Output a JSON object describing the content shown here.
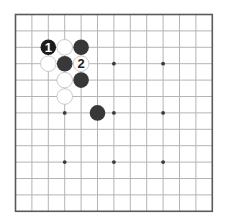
{
  "board": {
    "size": 13,
    "origin_x": 15.5,
    "origin_y": 14.5,
    "spacing": 16.4,
    "colors": {
      "background": "#ffffff",
      "grid_line": "#b4b4b4",
      "border": "#5a5a5a",
      "star_point": "#3a3a3a",
      "black_stone": "#383838",
      "black_stone_numbered": "#1c1c1c",
      "white_stone": "#ffffff",
      "white_stone_edge": "#bdbdbd",
      "label_on_black": "#ffffff",
      "label_on_white": "#222222"
    },
    "star_points": [
      [
        3,
        3
      ],
      [
        6,
        3
      ],
      [
        9,
        3
      ],
      [
        3,
        6
      ],
      [
        6,
        6
      ],
      [
        9,
        6
      ],
      [
        3,
        9
      ],
      [
        6,
        9
      ],
      [
        9,
        9
      ]
    ],
    "stones": [
      {
        "col": 2,
        "row": 2,
        "color": "black",
        "label": "1"
      },
      {
        "col": 3,
        "row": 2,
        "color": "white",
        "label": ""
      },
      {
        "col": 4,
        "row": 2,
        "color": "black",
        "label": ""
      },
      {
        "col": 2,
        "row": 3,
        "color": "white",
        "label": ""
      },
      {
        "col": 3,
        "row": 3,
        "color": "black",
        "label": ""
      },
      {
        "col": 4,
        "row": 3,
        "color": "white",
        "label": "2"
      },
      {
        "col": 3,
        "row": 4,
        "color": "white",
        "label": ""
      },
      {
        "col": 4,
        "row": 4,
        "color": "black",
        "label": ""
      },
      {
        "col": 3,
        "row": 5,
        "color": "white",
        "label": ""
      },
      {
        "col": 5,
        "row": 6,
        "color": "black",
        "label": ""
      }
    ]
  }
}
